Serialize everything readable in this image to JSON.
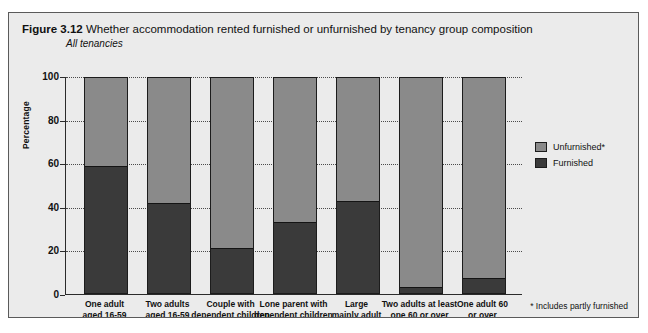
{
  "figure": {
    "number": "Figure 3.12",
    "title": "Whether accommodation rented furnished or unfurnished by tenancy group composition",
    "subtitle": "All tenancies",
    "footnote": "* Includes partly furnished"
  },
  "colors": {
    "unfurnished": "#8a8a8a",
    "furnished": "#3a3a3a",
    "panel_background": "#ebebeb",
    "axis": "#2b2b2b",
    "text": "#111111"
  },
  "legend": {
    "position": "right",
    "items": [
      {
        "label": "Unfurnished*",
        "color": "#8a8a8a"
      },
      {
        "label": "Furnished",
        "color": "#3a3a3a"
      }
    ]
  },
  "chart_data": {
    "type": "bar",
    "stacked": true,
    "title": "Whether accommodation rented furnished or unfurnished by tenancy group composition",
    "subtitle": "All tenancies",
    "xlabel": "",
    "ylabel": "Percentage",
    "ylim": [
      0,
      100
    ],
    "yticks": [
      0,
      20,
      40,
      60,
      80,
      100
    ],
    "ytick_labels": [
      "0",
      "20",
      "40",
      "60",
      "80",
      "100"
    ],
    "grid": true,
    "grid_axis": "y",
    "categories": [
      "One adult aged 16-59",
      "Two adults aged 16-59",
      "Couple with dependent children",
      "Lone parent with dependent children",
      "Large mainly adult",
      "Two adults at least one 60 or over",
      "One adult 60 or over"
    ],
    "category_lines": [
      [
        "One adult",
        "aged 16-59"
      ],
      [
        "Two adults",
        "aged 16-59"
      ],
      [
        "Couple with",
        "dependent children"
      ],
      [
        "Lone parent with",
        "dependent children"
      ],
      [
        "Large",
        "mainly adult"
      ],
      [
        "Two adults at least",
        "one 60 or over"
      ],
      [
        "One adult 60",
        "or over"
      ]
    ],
    "series": [
      {
        "name": "Furnished",
        "color": "#3a3a3a",
        "values": [
          59,
          42,
          21,
          33,
          43,
          3,
          7
        ]
      },
      {
        "name": "Unfurnished*",
        "color": "#8a8a8a",
        "values": [
          41,
          58,
          79,
          67,
          57,
          97,
          93
        ]
      }
    ]
  }
}
